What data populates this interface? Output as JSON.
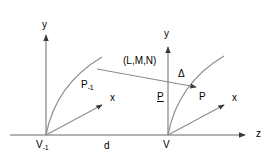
{
  "figure": {
    "type": "geometry-diagram",
    "background_color": "#ffffff",
    "line_color": "#808080",
    "curve_color": "#808080",
    "text_color": "#000000"
  },
  "labels": {
    "y_axis_left": "y",
    "y_axis_center": "y",
    "z_axis": "z",
    "x_axis_left": "x",
    "x_axis_right": "x",
    "vertex_left_main": "V",
    "vertex_left_sub": "-1",
    "vertex_right": "V",
    "point_left_main": "P",
    "point_left_sub": "-1",
    "point_center": "P",
    "point_right": "P",
    "direction_cosines": "(L,M,N)",
    "step_length": "Δ",
    "distance": "d"
  },
  "geometry": {
    "z_axis": {
      "x1": 10,
      "y1": 135,
      "x2": 247,
      "y2": 135
    },
    "y_axis_left": {
      "x1": 46,
      "y1": 135,
      "x2": 46,
      "y2": 33
    },
    "y_axis_center": {
      "x1": 168,
      "y1": 135,
      "x2": 168,
      "y2": 45
    },
    "x_axis_left": {
      "x1": 46,
      "y1": 135,
      "x2": 104,
      "y2": 104
    },
    "x_axis_right": {
      "x1": 168,
      "y1": 135,
      "x2": 226,
      "y2": 104
    },
    "curve_left": {
      "start_x": 46,
      "start_y": 135,
      "end_x": 102,
      "end_y": 56
    },
    "curve_right": {
      "start_x": 168,
      "start_y": 135,
      "end_x": 224,
      "end_y": 55
    },
    "vector_lmn": {
      "x1": 98,
      "y1": 70,
      "x2": 199,
      "y2": 88
    }
  }
}
